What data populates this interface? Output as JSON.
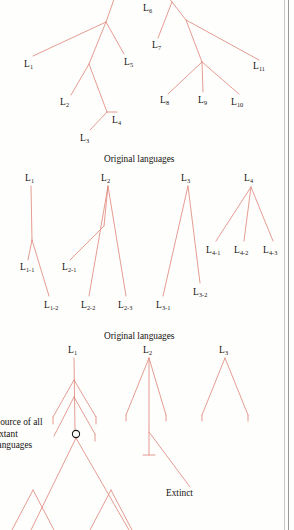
{
  "figure": {
    "title_repeated": "Original languages",
    "panels": [
      {
        "id": "panel-top",
        "leaf_labels": [
          "L1",
          "L2",
          "L3",
          "L4",
          "L5",
          "L6",
          "L7",
          "L8",
          "L9",
          "L10",
          "L11"
        ]
      },
      {
        "id": "panel-middle",
        "caption": "Original languages",
        "parent_labels": [
          "L1",
          "L2",
          "L3",
          "L4"
        ],
        "child_labels": [
          "L1-1",
          "L1-2",
          "L2-1",
          "L2-2",
          "L2-3",
          "L3-1",
          "L3-2",
          "L4-1",
          "L4-2",
          "L4-3"
        ]
      },
      {
        "id": "panel-bottom",
        "caption": "Original languages",
        "parent_labels": [
          "L1",
          "L2",
          "L3"
        ],
        "source_note": "Source of all extant languages",
        "source_note_lines": [
          "Source of all",
          "extant",
          "languages"
        ],
        "extinct_label": "Extinct"
      }
    ]
  },
  "labels": {
    "top": [
      {
        "name": "L1",
        "base": "L",
        "sub": "1",
        "x": 24,
        "y": 60
      },
      {
        "name": "L2",
        "base": "L",
        "sub": "2",
        "x": 60,
        "y": 98
      },
      {
        "name": "L3",
        "base": "L",
        "sub": "3",
        "x": 80,
        "y": 134
      },
      {
        "name": "L4",
        "base": "L",
        "sub": "4",
        "x": 112,
        "y": 116
      },
      {
        "name": "L5",
        "base": "L",
        "sub": "5",
        "x": 124,
        "y": 58
      },
      {
        "name": "L6",
        "base": "L",
        "sub": "6",
        "x": 143,
        "y": 4
      },
      {
        "name": "L7",
        "base": "L",
        "sub": "7",
        "x": 152,
        "y": 41
      },
      {
        "name": "L8",
        "base": "L",
        "sub": "8",
        "x": 160,
        "y": 96
      },
      {
        "name": "L9",
        "base": "L",
        "sub": "9",
        "x": 198,
        "y": 96
      },
      {
        "name": "L10",
        "base": "L",
        "sub": "10",
        "x": 231,
        "y": 98
      },
      {
        "name": "L11",
        "base": "L",
        "sub": "11",
        "x": 253,
        "y": 62
      }
    ],
    "middle_parents": [
      {
        "name": "L1",
        "base": "L",
        "sub": "1",
        "x": 25,
        "y": 174
      },
      {
        "name": "L2",
        "base": "L",
        "sub": "2",
        "x": 101,
        "y": 174
      },
      {
        "name": "L3",
        "base": "L",
        "sub": "3",
        "x": 181,
        "y": 174
      },
      {
        "name": "L4",
        "base": "L",
        "sub": "4",
        "x": 244,
        "y": 174
      }
    ],
    "middle_children": [
      {
        "name": "L1-1",
        "base": "L",
        "sub": "1-1",
        "x": 20,
        "y": 263
      },
      {
        "name": "L1-2",
        "base": "L",
        "sub": "1-2",
        "x": 44,
        "y": 301
      },
      {
        "name": "L2-1",
        "base": "L",
        "sub": "2-1",
        "x": 62,
        "y": 263
      },
      {
        "name": "L2-2",
        "base": "L",
        "sub": "2-2",
        "x": 81,
        "y": 301
      },
      {
        "name": "L2-3",
        "base": "L",
        "sub": "2-3",
        "x": 118,
        "y": 301
      },
      {
        "name": "L3-1",
        "base": "L",
        "sub": "3-1",
        "x": 156,
        "y": 301
      },
      {
        "name": "L3-2",
        "base": "L",
        "sub": "3-2",
        "x": 193,
        "y": 288
      },
      {
        "name": "L4-1",
        "base": "L",
        "sub": "4-1",
        "x": 206,
        "y": 246
      },
      {
        "name": "L4-2",
        "base": "L",
        "sub": "4-2",
        "x": 234,
        "y": 246
      },
      {
        "name": "L4-3",
        "base": "L",
        "sub": "4-3",
        "x": 263,
        "y": 246
      }
    ],
    "bottom_parents": [
      {
        "name": "L1",
        "base": "L",
        "sub": "1",
        "x": 68,
        "y": 346
      },
      {
        "name": "L2",
        "base": "L",
        "sub": "2",
        "x": 143,
        "y": 346
      },
      {
        "name": "L3",
        "base": "L",
        "sub": "3",
        "x": 219,
        "y": 346
      }
    ]
  },
  "captions": {
    "middle": {
      "text": "Original languages",
      "x": 104,
      "y": 155
    },
    "bottom": {
      "text": "Original languages",
      "x": 104,
      "y": 332
    },
    "extinct": {
      "text": "Extinct",
      "x": 166,
      "y": 489
    },
    "source": {
      "line1": "Source of all",
      "line2": "extant",
      "line3": "languages",
      "x": -5,
      "y": 417
    }
  },
  "colors": {
    "branch": "#e08a7e",
    "branch_dark": "#d4756a",
    "text": "#15120f",
    "paper": "#fefefd",
    "node_ring": "#1a1a1a",
    "page_edge": "#9a9a96"
  }
}
